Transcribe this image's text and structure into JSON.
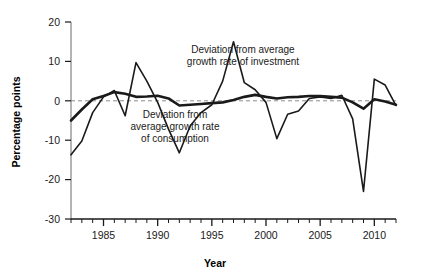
{
  "chart_data": {
    "type": "line",
    "title": "",
    "xlabel": "Year",
    "ylabel": "Percentage points",
    "xlim": [
      1982,
      2012
    ],
    "ylim": [
      -30,
      20
    ],
    "yticks": [
      20,
      10,
      0,
      -10,
      -20,
      -30
    ],
    "ytick_labels": [
      "20",
      "10",
      "0",
      "-10",
      "-20",
      "-30"
    ],
    "xticks": [
      1982,
      1983,
      1984,
      1985,
      1986,
      1987,
      1988,
      1989,
      1990,
      1991,
      1992,
      1993,
      1994,
      1995,
      1996,
      1997,
      1998,
      1999,
      2000,
      2001,
      2002,
      2003,
      2004,
      2005,
      2006,
      2007,
      2008,
      2009,
      2010,
      2011,
      2012
    ],
    "xtick_labels": [
      {
        "value": 1985,
        "label": "1985"
      },
      {
        "value": 1990,
        "label": "1990"
      },
      {
        "value": 1995,
        "label": "1995"
      },
      {
        "value": 2000,
        "label": "2000"
      },
      {
        "value": 2005,
        "label": "2005"
      },
      {
        "value": 2010,
        "label": "2010"
      }
    ],
    "grid": false,
    "legend_position": "inline-annotations",
    "zero_line": {
      "value": 0,
      "style": "dashed",
      "color": "#8c8c8c"
    },
    "series": [
      {
        "name": "Deviation from average growth rate of investment",
        "color": "#1a1a1a",
        "width": 1.6,
        "x": [
          1982,
          1983,
          1984,
          1985,
          1986,
          1987,
          1988,
          1989,
          1990,
          1991,
          1992,
          1993,
          1994,
          1995,
          1996,
          1997,
          1998,
          1999,
          2000,
          2001,
          2002,
          2003,
          2004,
          2005,
          2006,
          2007,
          2008,
          2009,
          2010,
          2011,
          2012
        ],
        "values": [
          -13.7,
          -10.2,
          -3.0,
          1.0,
          2.6,
          -3.8,
          9.7,
          5.0,
          -0.4,
          -7.2,
          -13.2,
          -6.4,
          -3.0,
          -1.0,
          5.0,
          15.0,
          4.6,
          2.8,
          -0.4,
          -9.6,
          -3.4,
          -2.6,
          0.6,
          1.0,
          0.6,
          1.4,
          -4.6,
          -23.0,
          5.5,
          4.0,
          -1.2
        ]
      },
      {
        "name": "Deviation from average growth rate of consumption",
        "color": "#1a1a1a",
        "width": 2.6,
        "x": [
          1982,
          1983,
          1984,
          1985,
          1986,
          1987,
          1988,
          1989,
          1990,
          1991,
          1992,
          1993,
          1994,
          1995,
          1996,
          1997,
          1998,
          1999,
          2000,
          2001,
          2002,
          2003,
          2004,
          2005,
          2006,
          2007,
          2008,
          2009,
          2010,
          2011,
          2012
        ],
        "values": [
          -5.0,
          -2.2,
          0.4,
          1.2,
          2.2,
          1.8,
          1.0,
          1.1,
          1.3,
          0.6,
          -1.2,
          -1.0,
          -0.8,
          -0.6,
          -0.4,
          0.2,
          1.0,
          1.5,
          1.0,
          0.6,
          0.9,
          1.0,
          1.2,
          1.2,
          1.0,
          0.8,
          -0.4,
          -2.0,
          0.4,
          -0.2,
          -1.0
        ]
      }
    ],
    "annotations": [
      {
        "id": "investment-label",
        "lines": [
          "Deviation from average",
          "growth rate of investment"
        ],
        "x": 243,
        "y": 53
      },
      {
        "id": "consumption-label",
        "lines": [
          "Deviation from",
          "average growth rate",
          "of consumption"
        ],
        "x": 175,
        "y": 118
      }
    ]
  }
}
